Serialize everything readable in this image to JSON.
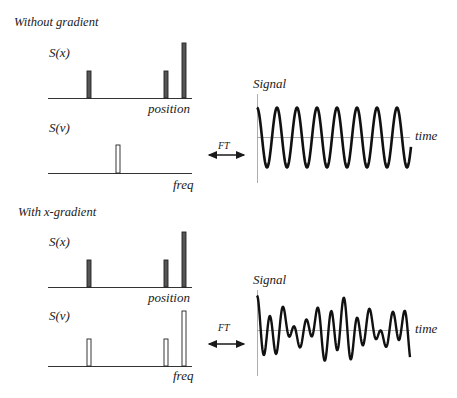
{
  "sections": [
    {
      "title": "Without gradient",
      "position_panel": {
        "label": "S(x)",
        "axis_label": "position",
        "bars": [
          {
            "x": 89,
            "height": 27
          },
          {
            "x": 166,
            "height": 27
          },
          {
            "x": 184,
            "height": 55
          }
        ]
      },
      "frequency_panel": {
        "label": "S(ν)",
        "axis_label": "freq",
        "bars": [
          {
            "x": 118,
            "height": 28
          }
        ]
      },
      "transform_label": "FT",
      "signal_panel": {
        "label": "Signal",
        "axis_label": "time",
        "description": "single-frequency sinusoid, ~8 cycles"
      }
    },
    {
      "title": "With x-gradient",
      "position_panel": {
        "label": "S(x)",
        "axis_label": "position",
        "bars": [
          {
            "x": 89,
            "height": 27
          },
          {
            "x": 166,
            "height": 27
          },
          {
            "x": 184,
            "height": 55
          }
        ]
      },
      "frequency_panel": {
        "label": "S(ν)",
        "axis_label": "freq",
        "bars": [
          {
            "x": 89,
            "height": 27
          },
          {
            "x": 166,
            "height": 27
          },
          {
            "x": 184,
            "height": 55
          }
        ]
      },
      "transform_label": "FT",
      "signal_panel": {
        "label": "Signal",
        "axis_label": "time",
        "description": "superposition of three frequencies (interference pattern)"
      }
    }
  ],
  "colors": {
    "ink": "#1a1a1a",
    "axis": "#333333",
    "bar_fill_position": "#555555",
    "bar_fill_frequency": "#ffffff",
    "center_line": "#888888"
  }
}
